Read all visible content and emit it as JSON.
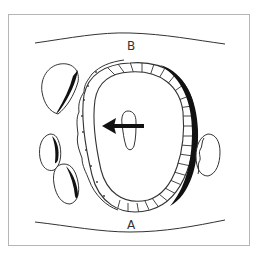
{
  "diagram": {
    "labels": {
      "top": "B",
      "bottom": "A"
    },
    "elements": {
      "top_boundary": "wavy-line",
      "bottom_boundary": "wavy-line",
      "central_body": "rounded-ring-with-hatched-wall",
      "inner_lumen": "drop-shaped-outline",
      "arrow_direction": "left",
      "satellite_bodies": 4
    },
    "colors": {
      "stroke": "#333333",
      "fill_dark": "#111111",
      "frame": "#b5b5b5",
      "background": "#ffffff"
    }
  }
}
